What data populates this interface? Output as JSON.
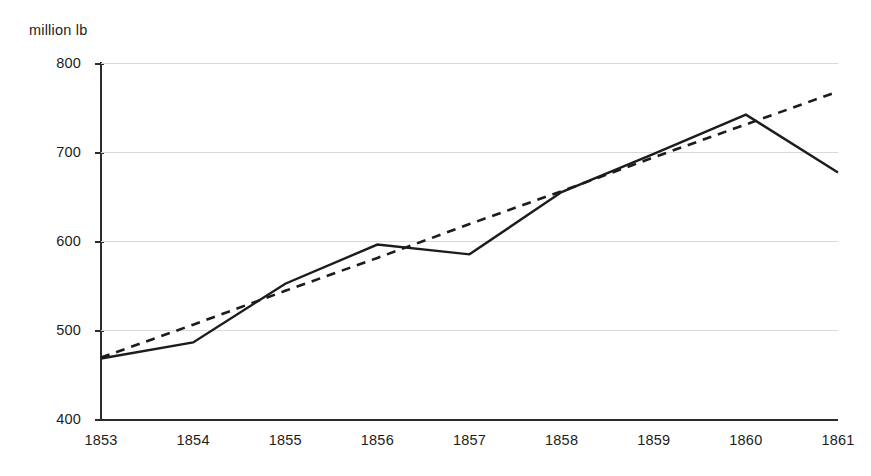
{
  "chart_data": {
    "type": "line",
    "title": "",
    "subtitle": "",
    "xlabel": "",
    "ylabel": "million lb",
    "unit_label": "million lb",
    "x": [
      1853,
      1854,
      1855,
      1856,
      1857,
      1858,
      1859,
      1860,
      1861
    ],
    "categories": [
      "1853",
      "1854",
      "1855",
      "1856",
      "1857",
      "1858",
      "1859",
      "1860",
      "1861"
    ],
    "xlim": [
      1853,
      1861
    ],
    "ylim": [
      400,
      800
    ],
    "yticks": [
      400,
      500,
      600,
      700,
      800
    ],
    "ytick_labels": [
      "400",
      "500",
      "600",
      "700",
      "800"
    ],
    "grid": "horizontal",
    "legend": "none",
    "series": [
      {
        "name": "actual",
        "style": "solid",
        "color": "#1c1c1c",
        "values": [
          468,
          486,
          552,
          596,
          585,
          655,
          698,
          742,
          677
        ]
      },
      {
        "name": "trend",
        "style": "dashed",
        "color": "#1c1c1c",
        "values": [
          469,
          506,
          544,
          581,
          619,
          656,
          694,
          731,
          768
        ]
      }
    ]
  },
  "axes": {
    "y_unit": "million lb"
  }
}
